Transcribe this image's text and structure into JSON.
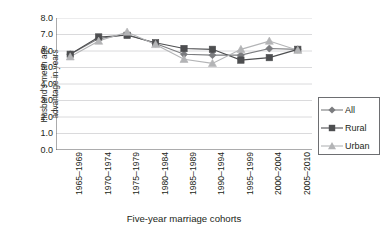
{
  "chart_data": {
    "type": "line",
    "title": "",
    "xlabel": "Five-year marriage cohorts",
    "ylabel": "Husband's mean age advantage in years",
    "ylabel_line1": "Husband's mean age",
    "ylabel_line2": "advantage in years",
    "categories": [
      "1965–1969",
      "1970–1974",
      "1975–1979",
      "1980–1984",
      "1985–1989",
      "1990–1994",
      "1995–1999",
      "2000–2004",
      "2005–2010"
    ],
    "ylim": [
      0.0,
      8.0
    ],
    "ytick_step": 1.0,
    "yticks": [
      "8.0",
      "7.0",
      "6.0",
      "5.0",
      "4.0",
      "3.0",
      "2.0",
      "1.0",
      "0.0"
    ],
    "ytick_values": [
      8.0,
      7.0,
      6.0,
      5.0,
      4.0,
      3.0,
      2.0,
      1.0,
      0.0
    ],
    "grid": "horizontal",
    "legend_position": "right",
    "series": [
      {
        "name": "All",
        "marker": "diamond",
        "color": "#7b7c7f",
        "values": [
          5.8,
          6.75,
          7.0,
          6.45,
          5.8,
          5.75,
          5.75,
          6.15,
          6.1
        ]
      },
      {
        "name": "Rural",
        "marker": "square",
        "color": "#4d4e50",
        "values": [
          5.8,
          6.85,
          6.95,
          6.5,
          6.15,
          6.1,
          5.45,
          5.6,
          6.1
        ]
      },
      {
        "name": "Urban",
        "marker": "triangle",
        "color": "#b3b4b6",
        "values": [
          5.65,
          6.6,
          7.15,
          6.4,
          5.5,
          5.25,
          6.1,
          6.6,
          6.05
        ]
      }
    ]
  },
  "legend": {
    "items": [
      {
        "label": "All"
      },
      {
        "label": "Rural"
      },
      {
        "label": "Urban"
      }
    ]
  }
}
